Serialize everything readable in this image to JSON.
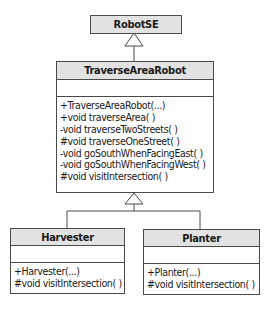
{
  "diagram": {
    "type": "uml-class-hierarchy",
    "colors": {
      "header_fill": "#e2e2e2",
      "border": "#4a4a4a",
      "text": "#1a1a1a"
    },
    "classes": {
      "robotse": {
        "name": "RobotSE",
        "operations": []
      },
      "traverse": {
        "name": "TraverseAreaRobot",
        "operations": [
          "+TraverseAreaRobot(...)",
          "+void traverseArea( )",
          "-void traverseTwoStreets( )",
          "#void traverseOneStreet( )",
          "-void goSouthWhenFacingEast( )",
          "-void goSouthWhenFacingWest( )",
          "#void visitIntersection( )"
        ]
      },
      "harvester": {
        "name": "Harvester",
        "operations": [
          "+Harvester(...)",
          "#void visitIntersection( )"
        ]
      },
      "planter": {
        "name": "Planter",
        "operations": [
          "+Planter(...)",
          "#void visitIntersection( )"
        ]
      }
    },
    "relationships": [
      {
        "from": "TraverseAreaRobot",
        "to": "RobotSE",
        "type": "inheritance"
      },
      {
        "from": "Harvester",
        "to": "TraverseAreaRobot",
        "type": "inheritance"
      },
      {
        "from": "Planter",
        "to": "TraverseAreaRobot",
        "type": "inheritance"
      }
    ]
  }
}
